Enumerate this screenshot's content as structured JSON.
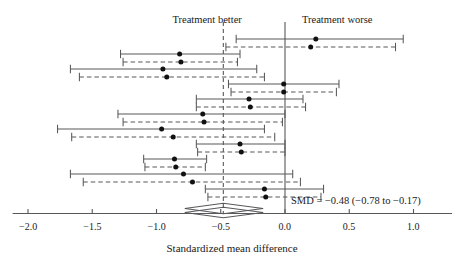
{
  "chart_data": {
    "type": "forest",
    "title": "",
    "xlabel": "Standardized mean difference",
    "ylabel": "",
    "xlim": [
      -2.15,
      1.32
    ],
    "xticks": [
      -2.0,
      -1.5,
      -1.0,
      -0.5,
      0.0,
      0.5,
      1.0
    ],
    "xtick_labels": [
      "−2.0",
      "−1.5",
      "−1.0",
      "−0.5",
      "0.0",
      "0.5",
      "1.0"
    ],
    "grid": false,
    "legend": "none",
    "null_line": 0.0,
    "pooled_line": -0.48,
    "region_labels": {
      "left": "Treatment better",
      "right": "Treatment worse"
    },
    "summary": {
      "label": "SMD = −0.48 (−0.78 to −0.17)",
      "estimate": -0.48,
      "ci_low": -0.78,
      "ci_high": -0.17
    },
    "series": [
      {
        "name": "solid",
        "style": "solid",
        "description": "primary analysis"
      },
      {
        "name": "dashed",
        "style": "dashed",
        "description": "sensitivity analysis"
      }
    ],
    "studies": [
      {
        "index": 1,
        "solid": {
          "estimate": 0.24,
          "ci_low": -0.38,
          "ci_high": 0.92
        },
        "dashed": {
          "estimate": 0.2,
          "ci_low": -0.46,
          "ci_high": 0.86
        }
      },
      {
        "index": 2,
        "solid": {
          "estimate": -0.82,
          "ci_low": -1.28,
          "ci_high": -0.35
        },
        "dashed": {
          "estimate": -0.81,
          "ci_low": -1.26,
          "ci_high": -0.37
        }
      },
      {
        "index": 3,
        "solid": {
          "estimate": -0.95,
          "ci_low": -1.67,
          "ci_high": -0.22
        },
        "dashed": {
          "estimate": -0.92,
          "ci_low": -1.6,
          "ci_high": -0.16
        }
      },
      {
        "index": 4,
        "solid": {
          "estimate": -0.01,
          "ci_low": -0.44,
          "ci_high": 0.42
        },
        "dashed": {
          "estimate": -0.01,
          "ci_low": -0.42,
          "ci_high": 0.4
        }
      },
      {
        "index": 5,
        "solid": {
          "estimate": -0.28,
          "ci_low": -0.69,
          "ci_high": 0.14
        },
        "dashed": {
          "estimate": -0.27,
          "ci_low": -0.69,
          "ci_high": 0.16
        }
      },
      {
        "index": 6,
        "solid": {
          "estimate": -0.64,
          "ci_low": -1.3,
          "ci_high": 0.0
        },
        "dashed": {
          "estimate": -0.63,
          "ci_low": -1.26,
          "ci_high": -0.02
        }
      },
      {
        "index": 7,
        "solid": {
          "estimate": -0.96,
          "ci_low": -1.77,
          "ci_high": -0.16
        },
        "dashed": {
          "estimate": -0.87,
          "ci_low": -1.66,
          "ci_high": -0.08
        }
      },
      {
        "index": 8,
        "solid": {
          "estimate": -0.35,
          "ci_low": -0.69,
          "ci_high": 0.0
        },
        "dashed": {
          "estimate": -0.34,
          "ci_low": -0.68,
          "ci_high": 0.0
        }
      },
      {
        "index": 9,
        "solid": {
          "estimate": -0.86,
          "ci_low": -1.1,
          "ci_high": -0.61
        },
        "dashed": {
          "estimate": -0.85,
          "ci_low": -1.09,
          "ci_high": -0.62
        }
      },
      {
        "index": 10,
        "solid": {
          "estimate": -0.79,
          "ci_low": -1.67,
          "ci_high": 0.06
        },
        "dashed": {
          "estimate": -0.72,
          "ci_low": -1.57,
          "ci_high": 0.12
        }
      },
      {
        "index": 11,
        "solid": {
          "estimate": -0.16,
          "ci_low": -0.62,
          "ci_high": 0.3
        },
        "dashed": {
          "estimate": -0.15,
          "ci_low": -0.6,
          "ci_high": 0.28
        }
      }
    ]
  }
}
